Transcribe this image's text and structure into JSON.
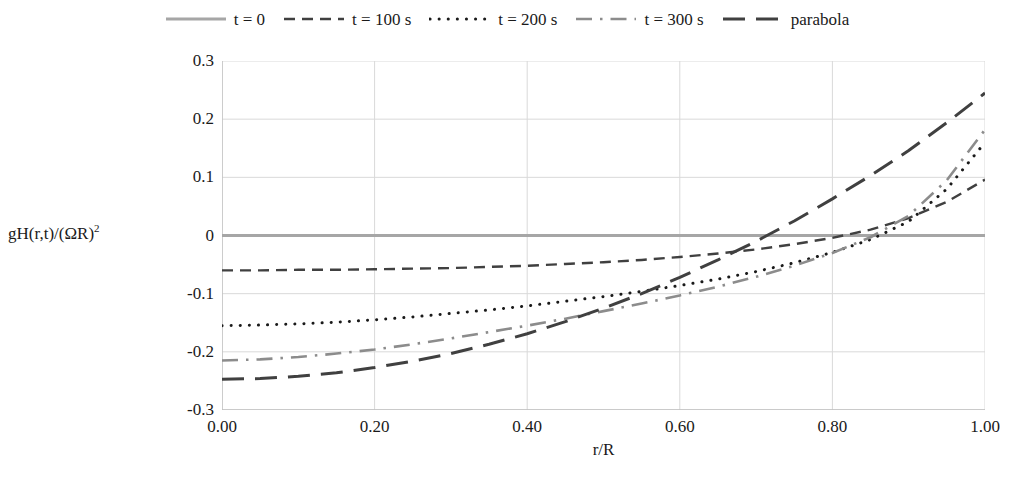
{
  "legend": {
    "position": "top-center",
    "entries": [
      {
        "label": "t = 0",
        "style": "solid",
        "color": "#a6a6a6",
        "width": 3.2
      },
      {
        "label": "t = 100 s",
        "style": "dashed",
        "color": "#404040",
        "width": 2.4
      },
      {
        "label": "t = 200 s",
        "style": "dotted",
        "color": "#1a1a1a",
        "width": 3.0
      },
      {
        "label": "t = 300 s",
        "style": "dashdot",
        "color": "#8c8c8c",
        "width": 2.6
      },
      {
        "label": "parabola",
        "style": "longdash",
        "color": "#404040",
        "width": 3.0
      }
    ]
  },
  "axes": {
    "ylabel_prefix": "gH(r,t)/(ΩR)",
    "ylabel_exponent": "2",
    "xlabel": "r/R",
    "yticks": [
      "0.3",
      "0.2",
      "0.1",
      "0",
      "-0.1",
      "-0.2",
      "-0.3"
    ],
    "xticks": [
      "0.00",
      "0.20",
      "0.40",
      "0.60",
      "0.80",
      "1.00"
    ],
    "gridcolor": "#d9d9d9",
    "axiscolor": "#bfbfbf"
  },
  "chart_data": {
    "type": "line",
    "title": "",
    "xlabel": "r/R",
    "ylabel": "gH(r,t)/(ΩR)^2",
    "xlim": [
      0.0,
      1.0
    ],
    "ylim": [
      -0.3,
      0.3
    ],
    "xticks": [
      0.0,
      0.2,
      0.4,
      0.6,
      0.8,
      1.0
    ],
    "yticks": [
      -0.3,
      -0.2,
      -0.1,
      0.0,
      0.1,
      0.2,
      0.3
    ],
    "grid": true,
    "legend_position": "top",
    "x": [
      0.0,
      0.05,
      0.1,
      0.15,
      0.2,
      0.25,
      0.3,
      0.35,
      0.4,
      0.45,
      0.5,
      0.55,
      0.6,
      0.65,
      0.7,
      0.75,
      0.8,
      0.85,
      0.9,
      0.95,
      1.0
    ],
    "series": [
      {
        "name": "t = 0",
        "style": "solid",
        "color": "#a6a6a6",
        "values": [
          0.0,
          0.0,
          0.0,
          0.0,
          0.0,
          0.0,
          0.0,
          0.0,
          0.0,
          0.0,
          0.0,
          0.0,
          0.0,
          0.0,
          0.0,
          0.0,
          0.0,
          0.0,
          0.0,
          0.0,
          0.0
        ]
      },
      {
        "name": "t = 100 s",
        "style": "dashed",
        "color": "#404040",
        "values": [
          -0.06,
          -0.06,
          -0.059,
          -0.059,
          -0.058,
          -0.057,
          -0.056,
          -0.054,
          -0.052,
          -0.049,
          -0.046,
          -0.042,
          -0.037,
          -0.031,
          -0.024,
          -0.015,
          -0.004,
          0.01,
          0.03,
          0.058,
          0.096
        ]
      },
      {
        "name": "t = 200 s",
        "style": "dotted",
        "color": "#1a1a1a",
        "values": [
          -0.155,
          -0.154,
          -0.152,
          -0.149,
          -0.145,
          -0.14,
          -0.134,
          -0.128,
          -0.121,
          -0.113,
          -0.105,
          -0.096,
          -0.086,
          -0.075,
          -0.062,
          -0.047,
          -0.029,
          -0.007,
          0.024,
          0.08,
          0.16
        ]
      },
      {
        "name": "t = 300 s",
        "style": "dashdot",
        "color": "#8c8c8c",
        "values": [
          -0.215,
          -0.213,
          -0.209,
          -0.203,
          -0.196,
          -0.187,
          -0.177,
          -0.166,
          -0.155,
          -0.143,
          -0.13,
          -0.117,
          -0.103,
          -0.088,
          -0.071,
          -0.052,
          -0.03,
          -0.003,
          0.034,
          0.095,
          0.182
        ]
      },
      {
        "name": "parabola",
        "style": "longdash",
        "color": "#404040",
        "values": [
          -0.247,
          -0.246,
          -0.242,
          -0.236,
          -0.227,
          -0.216,
          -0.203,
          -0.187,
          -0.169,
          -0.148,
          -0.125,
          -0.1,
          -0.072,
          -0.042,
          -0.01,
          0.025,
          0.063,
          0.103,
          0.146,
          0.194,
          0.245
        ]
      }
    ]
  }
}
